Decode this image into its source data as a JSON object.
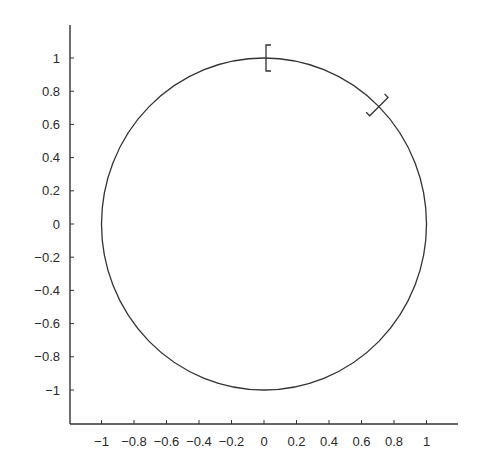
{
  "chart_data": {
    "type": "line",
    "title": "",
    "xlabel": "",
    "ylabel": "",
    "xlim": [
      -1.2,
      1.2
    ],
    "ylim": [
      -1.2,
      1.2
    ],
    "grid": false,
    "legend": null,
    "x_ticks": [
      -1,
      -0.8,
      -0.6,
      -0.4,
      -0.2,
      0,
      0.2,
      0.4,
      0.6,
      0.8,
      1
    ],
    "x_tick_labels": [
      "−1",
      "−0.8",
      "−0.6",
      "−0.4",
      "−0.2",
      "0",
      "0.2",
      "0.4",
      "0.6",
      "0.8",
      "1"
    ],
    "y_ticks": [
      1,
      0.8,
      0.6,
      0.4,
      0.2,
      0,
      -0.2,
      -0.4,
      -0.6,
      -0.8,
      -1
    ],
    "y_tick_labels": [
      "1",
      "0.8",
      "0.6",
      "0.4",
      "0.2",
      "0",
      "−0.2",
      "−0.4",
      "−0.6",
      "−0.8",
      "−1"
    ],
    "series": [
      {
        "name": "unit circle",
        "kind": "parametric",
        "x": "cos(t)",
        "y": "sin(t)",
        "t_range": [
          0,
          6.283
        ],
        "center": [
          0,
          0
        ],
        "radius": 1,
        "color": "#333333"
      }
    ],
    "annotations": [
      {
        "type": "bracket",
        "glyph": "[",
        "at": [
          0,
          1
        ],
        "angle_deg": 90,
        "description": "interval start marker at angle π/2"
      },
      {
        "type": "bracket",
        "glyph": "]",
        "at": [
          0.707,
          0.707
        ],
        "angle_deg": 45,
        "description": "interval end marker at angle π/4"
      }
    ]
  },
  "colors": {
    "axis": "#333333",
    "curve": "#333333",
    "text": "#2a2a2a",
    "background": "#ffffff"
  }
}
